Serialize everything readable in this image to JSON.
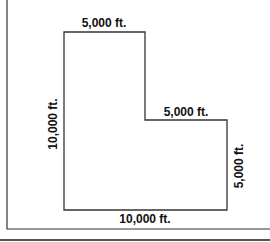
{
  "diagram": {
    "type": "L-shaped land parcel with dimensions",
    "labels": {
      "top": "5,000 ft.",
      "left": "10,000 ft.",
      "inner_step": "5,000 ft.",
      "right": "5,000 ft.",
      "bottom": "10,000 ft."
    },
    "colors": {
      "line": "#333333",
      "frame": "#333333",
      "background": "#ffffff"
    }
  }
}
